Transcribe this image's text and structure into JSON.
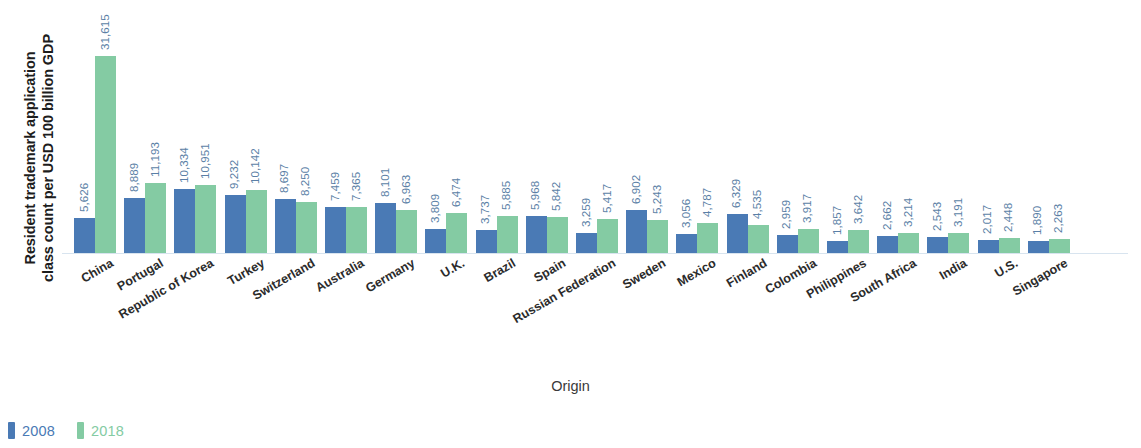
{
  "chart_data": {
    "type": "bar",
    "title": "",
    "xlabel": "Origin",
    "ylabel_line1": "Resident trademark application",
    "ylabel_line2": "class count per USD 100 billion GDP",
    "grid": false,
    "legend_position": "bottom-left",
    "ylim": [
      0,
      31615
    ],
    "categories": [
      "China",
      "Portugal",
      "Republic of Korea",
      "Turkey",
      "Switzerland",
      "Australia",
      "Germany",
      "U.K.",
      "Brazil",
      "Spain",
      "Russian Federation",
      "Sweden",
      "Mexico",
      "Finland",
      "Colombia",
      "Philippines",
      "South Africa",
      "India",
      "U.S.",
      "Singapore"
    ],
    "series": [
      {
        "name": "2008",
        "color": "#4a7ab5",
        "values": [
          5626,
          8889,
          10334,
          9232,
          8697,
          7459,
          8101,
          3809,
          3737,
          5968,
          3259,
          6902,
          3056,
          6329,
          2959,
          1857,
          2662,
          2543,
          2017,
          1890
        ],
        "labels": [
          "5,626",
          "8,889",
          "10,334",
          "9,232",
          "8,697",
          "7,459",
          "8,101",
          "3,809",
          "3,737",
          "5,968",
          "3,259",
          "6,902",
          "3,056",
          "6,329",
          "2,959",
          "1,857",
          "2,662",
          "2,543",
          "2,017",
          "1,890"
        ]
      },
      {
        "name": "2018",
        "color": "#84cba3",
        "values": [
          31615,
          11193,
          10951,
          10142,
          8250,
          7365,
          6963,
          6474,
          5885,
          5842,
          5417,
          5243,
          4787,
          4535,
          3917,
          3642,
          3214,
          3191,
          2448,
          2263
        ],
        "labels": [
          "31,615",
          "11,193",
          "10,951",
          "10,142",
          "8,250",
          "7,365",
          "6,963",
          "6,474",
          "5,885",
          "5,842",
          "5,417",
          "5,243",
          "4,787",
          "4,535",
          "3,917",
          "3,642",
          "3,214",
          "3,191",
          "2,448",
          "2,263"
        ]
      }
    ]
  },
  "legend": {
    "items": [
      {
        "label": "2008",
        "color": "#4a7ab5"
      },
      {
        "label": "2018",
        "color": "#84cba3"
      }
    ]
  },
  "axes": {
    "x_title": "Origin",
    "y_title_line1": "Resident trademark application",
    "y_title_line2": "class count per USD 100 billion GDP"
  }
}
